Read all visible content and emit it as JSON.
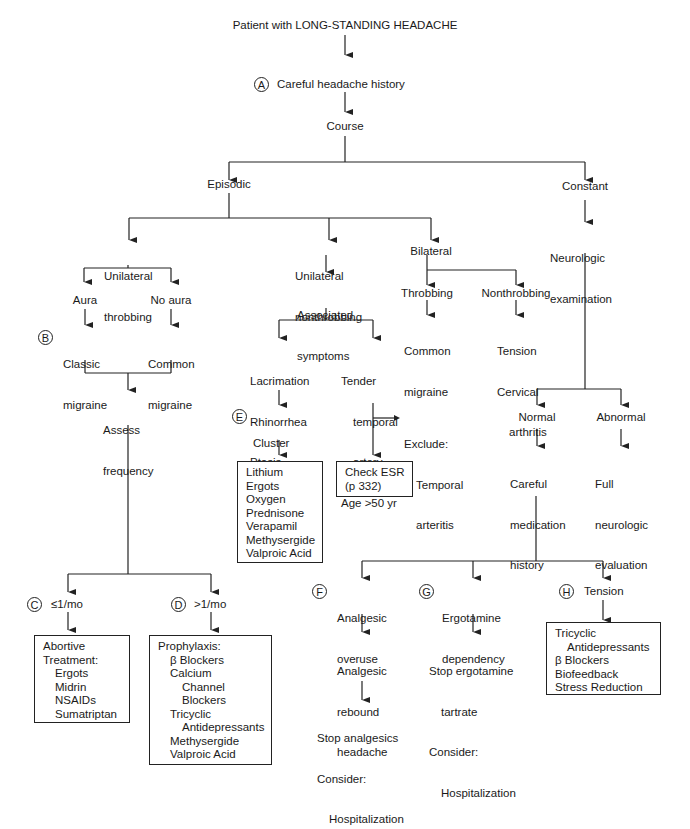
{
  "title": "Patient with LONG-STANDING HEADACHE",
  "nodes": {
    "A": {
      "badge": "A",
      "label": "Careful headache history"
    },
    "course": "Course",
    "episodic": "Episodic",
    "constant": "Constant",
    "neuro_exam": [
      "Neurologic",
      "examination"
    ],
    "uni_throb": [
      "Unilateral",
      "throbbing"
    ],
    "uni_nonthrob": [
      "Unilateral",
      "nonthrobbing"
    ],
    "bilateral": "Bilateral",
    "aura": "Aura",
    "no_aura": "No aura",
    "B": {
      "badge": "B",
      "label": [
        "Classic",
        "migraine"
      ]
    },
    "common_migraine_1": [
      "Common",
      "migraine"
    ],
    "assess_freq": [
      "Assess",
      "frequency"
    ],
    "assoc_symptoms": [
      "Associated",
      "symptoms"
    ],
    "lacrimation": [
      "Lacrimation",
      "Rhinorrhea",
      "Ptosis"
    ],
    "tender": [
      "Tender",
      "temporal",
      "artery",
      "Age >50 yr"
    ],
    "E": {
      "badge": "E",
      "label": [
        "Cluster",
        "headache"
      ]
    },
    "cluster_tx": [
      "Lithium",
      "Ergots",
      "Oxygen",
      "Prednisone",
      "Verapamil",
      "Methysergide",
      "Valproic Acid"
    ],
    "exclude": [
      "Exclude:",
      "Temporal",
      "arteritis"
    ],
    "check_esr": [
      "Check ESR",
      "(p 332)"
    ],
    "throbbing": "Throbbing",
    "nonthrobbing": "Nonthrobbing",
    "common_migraine_2": [
      "Common",
      "migraine"
    ],
    "tension_cerv": [
      "Tension",
      "Cervical",
      "arthritis"
    ],
    "normal": "Normal",
    "abnormal": "Abnormal",
    "careful_med": [
      "Careful",
      "medication",
      "history"
    ],
    "full_neuro": [
      "Full",
      "neurologic",
      "evaluation"
    ],
    "C": {
      "badge": "C",
      "label": "≤1/mo"
    },
    "D": {
      "badge": "D",
      "label": ">1/mo"
    },
    "abortive": {
      "lines": [
        "Abortive",
        "Treatment:",
        "Ergots",
        "Midrin",
        "NSAIDs",
        "Sumatriptan"
      ]
    },
    "prophylaxis": {
      "lines": [
        "Prophylaxis:",
        "β Blockers",
        "Calcium",
        "Channel",
        "Blockers",
        "Tricyclic",
        "Antidepressants",
        "Methysergide",
        "Valproic Acid"
      ]
    },
    "F": {
      "badge": "F",
      "label": [
        "Analgesic",
        "overuse"
      ]
    },
    "rebound": [
      "Analgesic",
      "rebound",
      "headache"
    ],
    "stop_analgesics": [
      "Stop analgesics",
      "Consider:",
      "Hospitalization"
    ],
    "G": {
      "badge": "G",
      "label": [
        "Ergotamine",
        "dependency"
      ]
    },
    "stop_ergot": [
      "Stop ergotamine",
      "tartrate",
      "Consider:",
      "Hospitalization"
    ],
    "H": {
      "badge": "H",
      "label": "Tension"
    },
    "tension_tx": {
      "lines": [
        "Tricyclic",
        "Antidepressants",
        "β Blockers",
        "Biofeedback",
        "Stress Reduction"
      ]
    }
  },
  "colors": {
    "line": "#222222",
    "text": "#1a1a1a",
    "background": "#ffffff"
  }
}
